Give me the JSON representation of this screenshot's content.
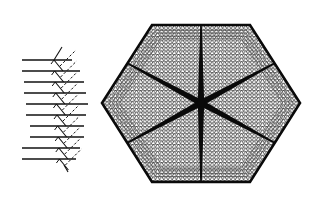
{
  "figure": {
    "colors": {
      "background": "#ffffff",
      "ink": "#111111",
      "lattice": "#222222"
    },
    "left_diagram": {
      "name": "ray-branching-diagram",
      "horizontal_lines": 10,
      "line_y": [
        60,
        71,
        82,
        93,
        104,
        115,
        126,
        137,
        148,
        159
      ],
      "line_x_start": [
        22,
        22,
        24,
        24,
        26,
        26,
        30,
        30,
        22,
        22
      ],
      "line_x_end": [
        72,
        80,
        84,
        86,
        88,
        86,
        84,
        84,
        80,
        76
      ]
    },
    "hexagon": {
      "name": "hexagonal-lattice",
      "center": [
        201,
        103
      ],
      "vertices": [
        [
          152,
          25
        ],
        [
          250,
          25
        ],
        [
          300,
          103
        ],
        [
          250,
          182
        ],
        [
          152,
          182
        ],
        [
          102,
          103
        ]
      ],
      "spokes": 6
    }
  }
}
